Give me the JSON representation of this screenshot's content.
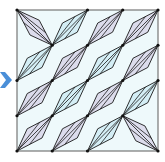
{
  "diagram": {
    "type": "kite-tiling",
    "grid": {
      "rows": 4,
      "cols": 4
    },
    "frame": {
      "x": 17,
      "y": 10,
      "width": 141,
      "height": 141
    },
    "colors": {
      "background": "#eef9fb",
      "frame_stroke": "#777777",
      "kite_stroke": "#1a1a1a",
      "purple_fill": "#dcdcec",
      "blue_fill": "#d4eef5",
      "node": "#111111",
      "arrow": "#4a8fd8"
    },
    "cells": [
      [
        {
          "dir": "\\",
          "fill": "purple"
        },
        {
          "dir": "/",
          "fill": "blue"
        },
        {
          "dir": "/",
          "fill": "purple"
        },
        {
          "dir": "/",
          "fill": "purple"
        }
      ],
      [
        {
          "dir": "/",
          "fill": "blue"
        },
        {
          "dir": "/",
          "fill": "purple"
        },
        {
          "dir": "/",
          "fill": "blue"
        },
        {
          "dir": "/",
          "fill": "purple"
        }
      ],
      [
        {
          "dir": "/",
          "fill": "purple"
        },
        {
          "dir": "/",
          "fill": "blue"
        },
        {
          "dir": "/",
          "fill": "purple"
        },
        {
          "dir": "/",
          "fill": "blue"
        }
      ],
      [
        {
          "dir": "/",
          "fill": "purple"
        },
        {
          "dir": "/",
          "fill": "purple"
        },
        {
          "dir": "/",
          "fill": "blue"
        },
        {
          "dir": "\\",
          "fill": "purple"
        }
      ]
    ]
  },
  "arrow": {
    "icon": "arrow-right-icon",
    "direction": "right"
  }
}
